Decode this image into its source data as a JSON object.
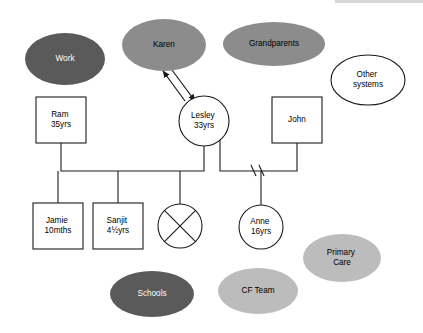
{
  "diagram": {
    "type": "genogram",
    "canvas": {
      "width": 423,
      "height": 333,
      "background": "#ffffff"
    },
    "palette": {
      "dark_ellipse_fill": "#5a5a5a",
      "dark_ellipse_text": "#ffffff",
      "medium_ellipse_fill": "#8c8c8c",
      "medium_ellipse_text": "#000000",
      "light_ellipse_fill": "#bcbcbc",
      "light_ellipse_text": "#000000",
      "white_fill": "#ffffff",
      "stroke": "#1a1a1a"
    }
  },
  "nodes": {
    "work": {
      "name": "Work",
      "shape": "ellipse",
      "style": "dark",
      "cx": 65,
      "cy": 59,
      "rx": 40,
      "ry": 26,
      "lines": [
        "Work"
      ]
    },
    "karen": {
      "name": "Karen",
      "shape": "ellipse",
      "style": "medium",
      "cx": 164,
      "cy": 45,
      "rx": 42,
      "ry": 26,
      "lines": [
        "Karen"
      ]
    },
    "grandparents": {
      "name": "Grandparents",
      "shape": "ellipse",
      "style": "medium",
      "cx": 274,
      "cy": 44,
      "rx": 51,
      "ry": 22,
      "lines": [
        "Grandparents"
      ]
    },
    "other_systems": {
      "name": "Other systems",
      "shape": "ellipse",
      "style": "white",
      "cx": 368,
      "cy": 80,
      "rx": 37,
      "ry": 25,
      "lines": [
        "Other",
        "systems"
      ]
    },
    "ram": {
      "name": "Ram",
      "shape": "rect",
      "style": "white",
      "x": 36,
      "y": 97,
      "w": 50,
      "h": 46,
      "lines": [
        "Ram",
        "35yrs"
      ]
    },
    "lesley": {
      "name": "Lesley",
      "shape": "circle",
      "style": "white",
      "cx": 204,
      "cy": 121,
      "r": 25,
      "lines": [
        "Lesley",
        "33yrs"
      ]
    },
    "john": {
      "name": "John",
      "shape": "rect",
      "style": "white",
      "x": 272,
      "y": 97,
      "w": 50,
      "h": 46,
      "lines": [
        "John"
      ]
    },
    "jamie": {
      "name": "Jamie",
      "shape": "rect",
      "style": "white",
      "x": 33,
      "y": 203,
      "w": 50,
      "h": 46,
      "lines": [
        "Jamie",
        "10mths"
      ]
    },
    "sanjit": {
      "name": "Sanjit",
      "shape": "rect",
      "style": "white",
      "x": 93,
      "y": 203,
      "w": 50,
      "h": 46,
      "lines": [
        "Sanjit",
        "4½yrs"
      ]
    },
    "deceased_child": {
      "name": "Deceased child",
      "shape": "circle-crossed",
      "style": "white",
      "cx": 180,
      "cy": 226,
      "r": 22,
      "lines": []
    },
    "anne": {
      "name": "Anne",
      "shape": "circle",
      "style": "white",
      "cx": 261,
      "cy": 227,
      "r": 22,
      "lines": [
        "Anne",
        "16yrs"
      ]
    },
    "primary_care": {
      "name": "Primary Care",
      "shape": "ellipse",
      "style": "light",
      "cx": 342,
      "cy": 258,
      "rx": 39,
      "ry": 24,
      "lines": [
        "Primary",
        "Care"
      ]
    },
    "schools": {
      "name": "Schools",
      "shape": "ellipse",
      "style": "dark",
      "cx": 152,
      "cy": 294,
      "rx": 42,
      "ry": 23,
      "lines": [
        "Schools"
      ]
    },
    "cf_team": {
      "name": "CF Team",
      "shape": "ellipse",
      "style": "light",
      "cx": 258,
      "cy": 291,
      "rx": 40,
      "ry": 23,
      "lines": [
        "CF Team"
      ]
    }
  },
  "connections": {
    "ram_lesley_partner": "M61,143 L61,171 L204,171 L204,146",
    "sibship_bar": "M61,171 L204,171",
    "jamie_drop": "M58,171 L58,203",
    "sanjit_drop": "M118,171 L118,203",
    "deceased_drop": "M180,171 L180,204",
    "lesley_john_partner": "M220,139 L220,171 L297,171 L297,143",
    "anne_drop": "M261,171 L261,205",
    "separation_mark_1": "M251,165 L256,176",
    "separation_mark_2": "M259,165 L264,176",
    "karen_lesley_arrow_out": "M172,70 L195,101",
    "karen_lesley_arrow_in": "M185,101 L163,71"
  },
  "annotations": {
    "separation_symbol": "double slash (relationship ended)",
    "deceased_symbol": "circle with cross (deceased / lost child)",
    "bidirectional_arrow": "Karen ↔ Lesley"
  }
}
